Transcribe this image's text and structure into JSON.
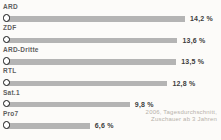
{
  "chart_data": {
    "type": "bar",
    "orientation": "horizontal",
    "title": "",
    "categories": [
      "ARD",
      "ZDF",
      "ARD-Dritte",
      "RTL",
      "Sat.1",
      "Pro7"
    ],
    "values": [
      14.2,
      13.6,
      13.5,
      12.8,
      9.8,
      6.6
    ],
    "value_labels": [
      "14,2 %",
      "13,6 %",
      "13,5 %",
      "12,8 %",
      "9,8 %",
      "6,6 %"
    ],
    "xlim": [
      0,
      14.2
    ],
    "grid": "off",
    "legend": "none",
    "marker": "ring",
    "bar_color": "#b4b4b4",
    "ring_color": "#141414",
    "value_color": "#3d3d3d",
    "label_color": "#5e5e5e",
    "source_note": {
      "line1": "2006, Tagesdurchschnitt,",
      "line2": "Zuschauer ab 3 Jahren",
      "color": "#b7b1aa"
    }
  }
}
